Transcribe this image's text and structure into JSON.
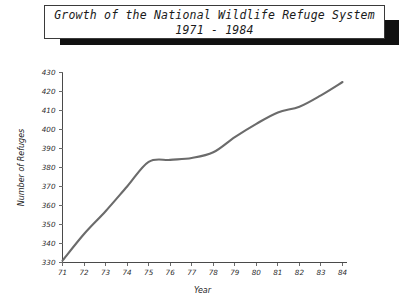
{
  "title": {
    "line1": "Growth of the National Wildlife Refuge System",
    "line2": "1971 - 1984"
  },
  "colors": {
    "line": "#6b6b6b",
    "axis": "#4a4a4a",
    "text": "#1a1a1a",
    "title_shadow": "#111111",
    "background": "#ffffff"
  },
  "chart_data": {
    "type": "line",
    "title": "Growth of the National Wildlife Refuge System 1971 - 1984",
    "xlabel": "Year",
    "ylabel": "Number of Refuges",
    "categories": [
      "71",
      "72",
      "73",
      "74",
      "75",
      "76",
      "77",
      "78",
      "79",
      "80",
      "81",
      "82",
      "83",
      "84"
    ],
    "x": [
      71,
      72,
      73,
      74,
      75,
      76,
      77,
      78,
      79,
      80,
      81,
      82,
      83,
      84
    ],
    "values": [
      331,
      345,
      357,
      370,
      383,
      384,
      385,
      388,
      396,
      403,
      409,
      412,
      418,
      425
    ],
    "series": [
      {
        "name": "Number of Refuges",
        "values": [
          331,
          345,
          357,
          370,
          383,
          384,
          385,
          388,
          396,
          403,
          409,
          412,
          418,
          425
        ]
      }
    ],
    "xlim": [
      71,
      84
    ],
    "ylim": [
      330,
      430
    ],
    "yticks": [
      330,
      340,
      350,
      360,
      370,
      380,
      390,
      400,
      410,
      420,
      430
    ],
    "ytick_labels": [
      "330",
      "340",
      "350",
      "360",
      "370",
      "380",
      "390",
      "400",
      "410",
      "420",
      "430"
    ],
    "xticks": [
      71,
      72,
      73,
      74,
      75,
      76,
      77,
      78,
      79,
      80,
      81,
      82,
      83,
      84
    ],
    "xtick_labels": [
      "71",
      "72",
      "73",
      "74",
      "75",
      "76",
      "77",
      "78",
      "79",
      "80",
      "81",
      "82",
      "83",
      "84"
    ],
    "grid": false,
    "legend": false,
    "legend_position": "none",
    "smooth": true
  }
}
